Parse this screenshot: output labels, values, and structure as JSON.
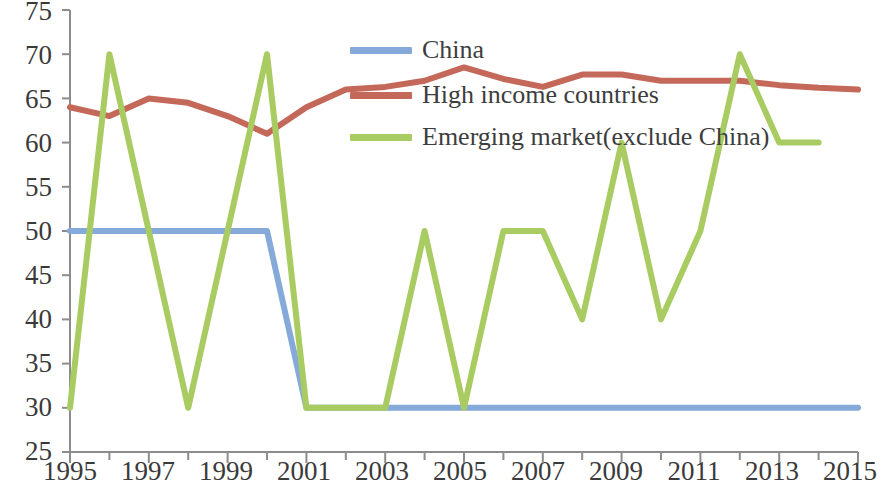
{
  "chart": {
    "type": "line",
    "title": "",
    "xlabel": "",
    "ylabel": ""
  },
  "axes": {
    "y_ticks": [
      "75",
      "70",
      "65",
      "60",
      "55",
      "50",
      "45",
      "40",
      "35",
      "30",
      "25"
    ],
    "x_ticks": [
      "1995",
      "1997",
      "1999",
      "2001",
      "2003",
      "2005",
      "2007",
      "2009",
      "2011",
      "2013",
      "2015"
    ],
    "ylim": [
      25,
      75
    ],
    "xlim": [
      1995,
      2015
    ],
    "grid": "none",
    "minor_x_ticks_every": 1
  },
  "legend": {
    "position": "inside-top-center",
    "items": [
      {
        "label": "China",
        "color": "#85a9d8"
      },
      {
        "label": "High income countries",
        "color": "#c4685a"
      },
      {
        "label": "Emerging market(exclude China)",
        "color": "#a8cc62"
      }
    ]
  },
  "colors": {
    "china": "#85a9d8",
    "high_income": "#c4685a",
    "emerging": "#a8cc62",
    "axis": "#8c8c8c",
    "text": "#3a3a3a",
    "background": "#ffffff"
  },
  "chart_data": {
    "type": "line",
    "title": "",
    "xlabel": "",
    "ylabel": "",
    "ylim": [
      25,
      75
    ],
    "grid": false,
    "legend_position": "inside-top-center",
    "x": [
      1995,
      1996,
      1997,
      1998,
      1999,
      2000,
      2001,
      2002,
      2003,
      2004,
      2005,
      2006,
      2007,
      2008,
      2009,
      2010,
      2011,
      2012,
      2013,
      2014,
      2015
    ],
    "series": [
      {
        "name": "China",
        "color": "#85a9d8",
        "values": [
          50,
          50,
          50,
          50,
          50,
          50,
          30,
          30,
          30,
          30,
          30,
          30,
          30,
          30,
          30,
          30,
          30,
          30,
          30,
          30,
          30
        ]
      },
      {
        "name": "High income countries",
        "color": "#c4685a",
        "values": [
          64,
          63,
          65,
          64.5,
          63,
          61,
          64,
          66,
          66.3,
          67,
          68.5,
          67.2,
          66.3,
          67.7,
          67.7,
          67,
          67,
          67,
          66.5,
          66.2,
          66
        ]
      },
      {
        "name": "Emerging market(exclude China)",
        "color": "#a8cc62",
        "values": [
          30,
          70,
          50,
          30,
          50,
          70,
          30,
          30,
          30,
          50,
          30,
          50,
          50,
          40,
          60,
          40,
          50,
          70,
          60,
          60,
          null
        ]
      }
    ]
  }
}
